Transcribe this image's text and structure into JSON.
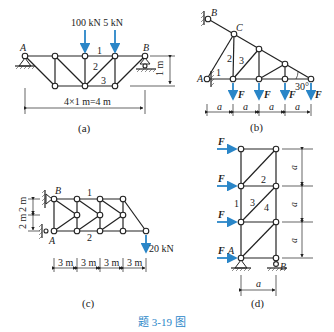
{
  "figure": {
    "caption": "题 3-19 图",
    "accent_color": "#2a86c8"
  },
  "panel_a": {
    "label": "(a)",
    "load_label": "100 kN 5 kN",
    "support_left": "A",
    "support_right": "B",
    "members": [
      "1",
      "2",
      "3"
    ],
    "height_dim": "1 m",
    "span_dim": "4×1 m=4 m"
  },
  "panel_b": {
    "label": "(b)",
    "nodes": [
      "B",
      "C",
      "A"
    ],
    "members": [
      "1",
      "2",
      "3"
    ],
    "angle": "30°",
    "forces": [
      "F",
      "F",
      "F",
      "F"
    ],
    "dims": [
      "a",
      "a",
      "a",
      "a"
    ]
  },
  "panel_c": {
    "label": "(c)",
    "nodes": [
      "B",
      "A"
    ],
    "members": [
      "1",
      "2"
    ],
    "height_dims": [
      "2 m",
      "2 m"
    ],
    "load": "20 kN",
    "span_dims": [
      "3 m",
      "3 m",
      "3 m",
      "3 m"
    ]
  },
  "panel_d": {
    "label": "(d)",
    "forces": [
      "F",
      "F",
      "F",
      "F"
    ],
    "nodes": [
      "A",
      "B"
    ],
    "members": [
      "1",
      "2",
      "3",
      "4"
    ],
    "height_dims": [
      "a",
      "a",
      "a"
    ],
    "width_dim": "a"
  }
}
